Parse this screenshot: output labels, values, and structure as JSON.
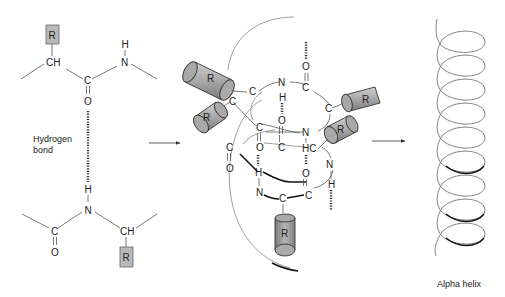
{
  "panels": {
    "left": {
      "name": "peptide-backbone-hydrogen-bond",
      "top_residue": {
        "r_group": "R",
        "alpha_carbon": "CH",
        "carbonyl_c": "C",
        "carbonyl_o": "O",
        "amide_n": "N",
        "amide_h": "H"
      },
      "bottom_residue": {
        "r_group": "R",
        "alpha_carbon": "CH",
        "carbonyl_c": "C",
        "carbonyl_o": "O",
        "amide_n": "N",
        "amide_h": "H"
      },
      "hydrogen_bond_label_line1": "Hydrogen",
      "hydrogen_bond_label_line2": "bond"
    },
    "middle": {
      "name": "helix-backbone-with-side-chains",
      "r_label": "R",
      "atoms": {
        "c": "C",
        "n": "N",
        "o": "O",
        "h": "H",
        "hc": "HC"
      }
    },
    "right": {
      "name": "alpha-helix-ribbon",
      "caption": "Alpha helix"
    }
  },
  "arrows": [
    {
      "from": "left",
      "to": "middle"
    },
    {
      "from": "middle",
      "to": "right"
    }
  ],
  "colors": {
    "r_box_fill": "#b8b8b8",
    "cylinder_fill": "#a0a0a0",
    "line": "#555555",
    "text": "#222222"
  }
}
